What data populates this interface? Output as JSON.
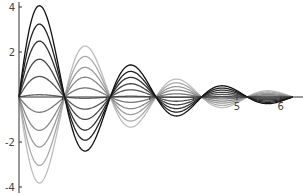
{
  "chart_data": {
    "type": "line",
    "title": "",
    "xlabel": "",
    "ylabel": "",
    "function": "c * exp(-x/2) * sin(3x)",
    "xlim": [
      0,
      6.283
    ],
    "ylim": [
      -4,
      4
    ],
    "grid": false,
    "legend": "none",
    "x_ticks": [
      1,
      2,
      3,
      4,
      5,
      6
    ],
    "x_tick_labels_visible": [
      "5",
      "6"
    ],
    "y_ticks": [
      -4,
      -2,
      2,
      4
    ],
    "y_tick_labels": [
      "-4",
      "-2",
      "2",
      "4"
    ],
    "series": [
      {
        "name": "c=-4.9",
        "c": -4.9,
        "first_lobe_peak": -3.8,
        "color": "#bdbdbd"
      },
      {
        "name": "c=-3.9",
        "c": -3.9,
        "first_lobe_peak": -3.0,
        "color": "#aaaaaa"
      },
      {
        "name": "c=-2.85",
        "c": -2.85,
        "first_lobe_peak": -2.2,
        "color": "#9a9a9a"
      },
      {
        "name": "c=-1.9",
        "c": -1.9,
        "first_lobe_peak": -1.45,
        "color": "#888888"
      },
      {
        "name": "c=-0.87",
        "c": -0.87,
        "first_lobe_peak": -0.67,
        "color": "#777777"
      },
      {
        "name": "c=0.13",
        "c": 0.13,
        "first_lobe_peak": 0.1,
        "color": "#666666"
      },
      {
        "name": "c=1.17",
        "c": 1.17,
        "first_lobe_peak": 0.9,
        "color": "#555555"
      },
      {
        "name": "c=2.15",
        "c": 2.15,
        "first_lobe_peak": 1.65,
        "color": "#444444"
      },
      {
        "name": "c=3.18",
        "c": 3.18,
        "first_lobe_peak": 2.45,
        "color": "#333333"
      },
      {
        "name": "c=4.15",
        "c": 4.15,
        "first_lobe_peak": 3.2,
        "color": "#222222"
      },
      {
        "name": "c=5.2",
        "c": 5.2,
        "first_lobe_peak": 4.0,
        "color": "#111111"
      }
    ]
  }
}
